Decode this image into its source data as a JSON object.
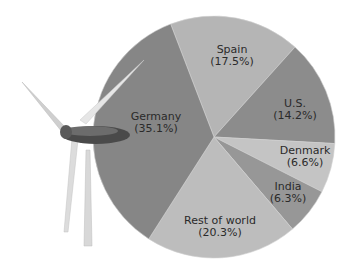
{
  "chart_data": {
    "type": "pie",
    "title": "",
    "categories": [
      "Spain",
      "U.S.",
      "Denmark",
      "India",
      "Rest of world",
      "Germany"
    ],
    "values": [
      17.5,
      14.2,
      6.6,
      6.3,
      20.3,
      35.1
    ],
    "labels": [
      "Spain (17.5%)",
      "U.S. (14.2%)",
      "Denmark (6.6%)",
      "India (6.3%)",
      "Rest of world (20.3%)",
      "Germany (35.1%)"
    ],
    "colors": [
      "#b5b5b5",
      "#8c8c8c",
      "#c4c4c4",
      "#979797",
      "#bdbdbd",
      "#868686"
    ],
    "legend": "none",
    "decoration": "wind-turbine-image"
  },
  "slices": [
    {
      "name": "Spain",
      "pct": "(17.5%)"
    },
    {
      "name": "U.S.",
      "pct": "(14.2%)"
    },
    {
      "name": "Denmark",
      "pct": "(6.6%)"
    },
    {
      "name": "India",
      "pct": "(6.3%)"
    },
    {
      "name": "Rest of world",
      "pct": "(20.3%)"
    },
    {
      "name": "Germany",
      "pct": "(35.1%)"
    }
  ]
}
